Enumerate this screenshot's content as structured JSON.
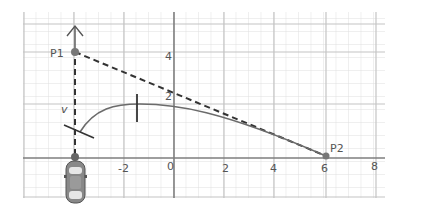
{
  "diagram": {
    "type": "path-planning-sketch",
    "grid": {
      "x_range": [
        -6,
        8.5
      ],
      "y_range": [
        -1.5,
        5.7
      ],
      "minor_step": 0.5,
      "major_step": 2
    },
    "axis_labels": {
      "x_ticks": [
        {
          "value": -2,
          "label": "-2"
        },
        {
          "value": 0,
          "label": "0"
        },
        {
          "value": 2,
          "label": "2"
        },
        {
          "value": 4,
          "label": "4"
        },
        {
          "value": 6,
          "label": "6"
        },
        {
          "value": 8,
          "label": "8"
        }
      ],
      "y_ticks": [
        {
          "value": 2,
          "label": "2"
        },
        {
          "value": 4,
          "label": "4"
        }
      ]
    },
    "points": [
      {
        "id": "p1",
        "label": "P1",
        "x": -4,
        "y": 4
      },
      {
        "id": "p2",
        "label": "P2",
        "x": 6,
        "y": 0
      }
    ],
    "velocity_label": "v",
    "vehicle": {
      "label": "car",
      "x": -4,
      "y": 0,
      "heading": "up"
    },
    "colors": {
      "grid_minor": "#dcdcdc",
      "grid_major": "#b9b9b9",
      "axis": "#8a8a8a",
      "ink": "#333333",
      "curve": "#6b6b6b",
      "car_body": "#7a7a7a",
      "car_glass": "#e6e6e6"
    }
  }
}
